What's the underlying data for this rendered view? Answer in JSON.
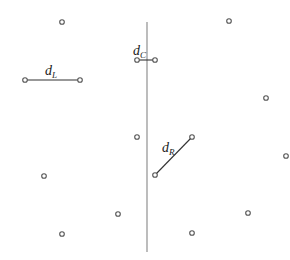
{
  "title": "",
  "points": [
    {
      "id": "p1",
      "x": 62,
      "y": 22
    },
    {
      "id": "p2",
      "x": 229,
      "y": 21
    },
    {
      "id": "p3",
      "x": 266,
      "y": 98
    },
    {
      "id": "p4",
      "x": 286,
      "y": 156
    },
    {
      "id": "p5",
      "x": 137,
      "y": 137
    },
    {
      "id": "p6",
      "x": 44,
      "y": 176
    },
    {
      "id": "p7",
      "x": 118,
      "y": 214
    },
    {
      "id": "p8",
      "x": 62,
      "y": 234
    },
    {
      "id": "p9",
      "x": 248,
      "y": 213
    },
    {
      "id": "p10",
      "x": 192,
      "y": 233
    }
  ],
  "segments": [
    {
      "id": "dL",
      "label_main": "d",
      "label_sub": "L",
      "from": {
        "x": 25,
        "y": 80
      },
      "to": {
        "x": 80,
        "y": 80
      }
    },
    {
      "id": "dC",
      "label_main": "d",
      "label_sub": "C",
      "from": {
        "x": 137,
        "y": 60
      },
      "to": {
        "x": 155,
        "y": 60
      }
    },
    {
      "id": "dR",
      "label_main": "d",
      "label_sub": "R",
      "from": {
        "x": 155,
        "y": 175
      },
      "to": {
        "x": 192,
        "y": 137
      }
    }
  ],
  "divider": {
    "x": 147,
    "y1": 22,
    "y2": 252
  }
}
